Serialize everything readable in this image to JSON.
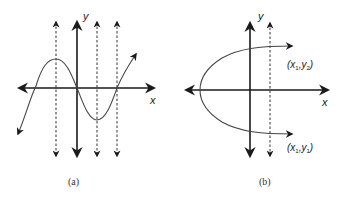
{
  "figure": {
    "panels": [
      {
        "id": "a",
        "caption": "(a)",
        "x_axis_label": "x",
        "y_axis_label": "y",
        "curve": "sine-like cubic crossing the x-axis three times",
        "vertical_test_lines": 3,
        "description": "Each vertical dashed line meets the curve once (function)"
      },
      {
        "id": "b",
        "caption": "(b)",
        "x_axis_label": "x",
        "y_axis_label": "y",
        "curve": "sideways parabola opening right",
        "vertical_test_lines": 1,
        "points": [
          {
            "label_main_x": "x",
            "label_sub_x": "1",
            "label_main_y": "y",
            "label_sub_y": "2"
          },
          {
            "label_main_x": "x",
            "label_sub_x": "1",
            "label_main_y": "y",
            "label_sub_y": "1"
          }
        ],
        "description": "Vertical dashed line meets the curve twice (not a function)"
      }
    ],
    "colors": {
      "axis": "#1a1a1a",
      "curve": "#444444",
      "background": "#ffffff"
    }
  }
}
